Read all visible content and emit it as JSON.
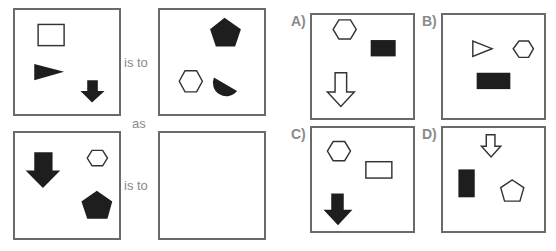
{
  "puzzle": {
    "connectors": {
      "is_to_top": "is to",
      "as": "as",
      "is_to_bottom": "is to"
    },
    "options": [
      {
        "label": "A)"
      },
      {
        "label": "B)"
      },
      {
        "label": "C)"
      },
      {
        "label": "D)"
      }
    ],
    "panels": {
      "top_left": [
        "outline-rectangle",
        "filled-triangle",
        "filled-down-arrow"
      ],
      "top_right": [
        "filled-pentagon",
        "outline-hexagon",
        "filled-half-circle"
      ],
      "bottom_left": [
        "filled-down-arrow",
        "outline-hexagon",
        "filled-pentagon"
      ],
      "bottom_right": [],
      "option_a": [
        "outline-hexagon",
        "filled-rectangle",
        "outline-down-arrow"
      ],
      "option_b": [
        "outline-triangle",
        "outline-hexagon",
        "filled-rectangle"
      ],
      "option_c": [
        "outline-hexagon",
        "outline-rectangle",
        "filled-down-arrow"
      ],
      "option_d": [
        "outline-down-arrow",
        "filled-rectangle",
        "outline-pentagon"
      ]
    },
    "colors": {
      "fill": "#1e1e1e",
      "stroke": "#333333",
      "border": "#6a6a6a",
      "text": "#8a8a8a"
    }
  }
}
